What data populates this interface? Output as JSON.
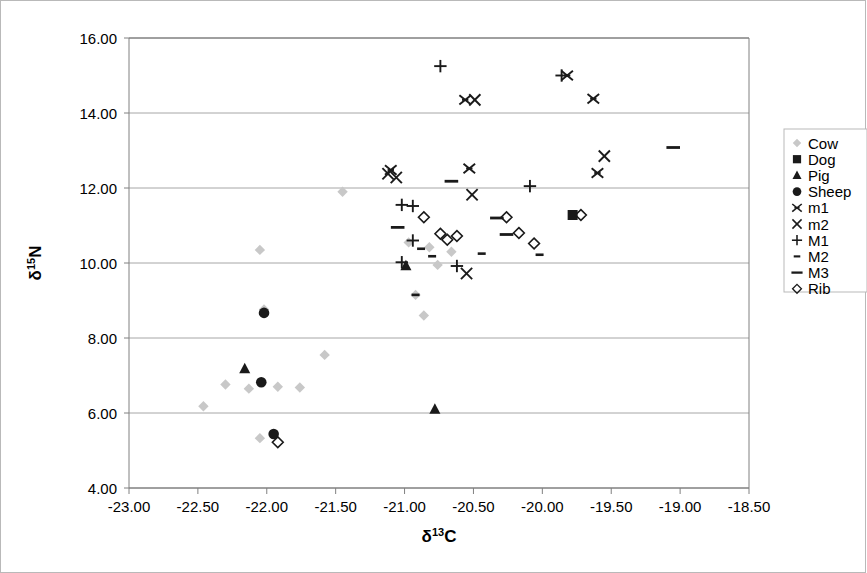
{
  "figure": {
    "background": "#ffffff",
    "frame_color": "#b9b9b9",
    "axis_color": "#808080",
    "grid_color": "#a6a6a6",
    "marker_color_dark": "#1a1a1a",
    "marker_color_light": "#c8c8c8"
  },
  "chart_data": {
    "type": "scatter",
    "title": "",
    "xlabel": "δ¹³C",
    "ylabel": "δ¹⁵N",
    "xlabel_parts": {
      "delta": "δ",
      "sup": "13",
      "element": "C"
    },
    "ylabel_parts": {
      "delta": "δ",
      "sup": "15",
      "element": "N"
    },
    "xlim": [
      -23.0,
      -18.5
    ],
    "ylim": [
      4.0,
      16.0
    ],
    "xticks": [
      -23.0,
      -22.5,
      -22.0,
      -21.5,
      -21.0,
      -20.5,
      -20.0,
      -19.5,
      -19.0,
      -18.5
    ],
    "yticks": [
      4.0,
      6.0,
      8.0,
      10.0,
      12.0,
      14.0,
      16.0
    ],
    "xtick_labels": [
      "-23.00",
      "-22.50",
      "-22.00",
      "-21.50",
      "-21.00",
      "-20.50",
      "-20.00",
      "-19.50",
      "-19.00",
      "-18.50"
    ],
    "ytick_labels": [
      "4.00",
      "6.00",
      "8.00",
      "10.00",
      "12.00",
      "14.00",
      "16.00"
    ],
    "grid": "horizontal",
    "legend_position": "right-outside",
    "series": [
      {
        "name": "Cow",
        "marker": "diamond-filled",
        "color": "#c8c8c8",
        "points": [
          {
            "x": -22.46,
            "y": 6.18
          },
          {
            "x": -22.3,
            "y": 6.76
          },
          {
            "x": -22.13,
            "y": 6.65
          },
          {
            "x": -21.92,
            "y": 6.7
          },
          {
            "x": -22.02,
            "y": 8.76
          },
          {
            "x": -22.05,
            "y": 5.33
          },
          {
            "x": -21.76,
            "y": 6.68
          },
          {
            "x": -21.58,
            "y": 7.55
          },
          {
            "x": -22.05,
            "y": 10.35
          },
          {
            "x": -21.45,
            "y": 11.9
          },
          {
            "x": -20.97,
            "y": 10.55
          },
          {
            "x": -20.82,
            "y": 10.42
          },
          {
            "x": -20.66,
            "y": 10.3
          },
          {
            "x": -20.76,
            "y": 9.95
          },
          {
            "x": -20.92,
            "y": 9.15
          },
          {
            "x": -20.86,
            "y": 8.6
          }
        ]
      },
      {
        "name": "Dog",
        "marker": "square-filled",
        "color": "#1a1a1a",
        "points": [
          {
            "x": -19.78,
            "y": 11.28
          }
        ]
      },
      {
        "name": "Pig",
        "marker": "triangle-filled",
        "color": "#1a1a1a",
        "points": [
          {
            "x": -22.16,
            "y": 7.18
          },
          {
            "x": -20.99,
            "y": 9.93
          },
          {
            "x": -20.78,
            "y": 6.1
          }
        ]
      },
      {
        "name": "Sheep",
        "marker": "circle-filled",
        "color": "#1a1a1a",
        "points": [
          {
            "x": -22.02,
            "y": 8.67
          },
          {
            "x": -22.04,
            "y": 6.82
          },
          {
            "x": -21.95,
            "y": 5.44
          }
        ]
      },
      {
        "name": "m1",
        "marker": "asterisk",
        "color": "#1a1a1a",
        "points": [
          {
            "x": -21.1,
            "y": 12.48
          },
          {
            "x": -20.56,
            "y": 14.35
          },
          {
            "x": -20.53,
            "y": 12.52
          },
          {
            "x": -19.82,
            "y": 15.0
          },
          {
            "x": -19.63,
            "y": 14.38
          },
          {
            "x": -19.6,
            "y": 12.4
          }
        ]
      },
      {
        "name": "m2",
        "marker": "x-cross",
        "color": "#1a1a1a",
        "points": [
          {
            "x": -21.12,
            "y": 12.38
          },
          {
            "x": -21.06,
            "y": 12.28
          },
          {
            "x": -20.49,
            "y": 14.35
          },
          {
            "x": -20.51,
            "y": 11.82
          },
          {
            "x": -20.55,
            "y": 9.72
          },
          {
            "x": -19.55,
            "y": 12.85
          }
        ]
      },
      {
        "name": "M1",
        "marker": "plus",
        "color": "#1a1a1a",
        "points": [
          {
            "x": -20.74,
            "y": 15.25
          },
          {
            "x": -19.86,
            "y": 15.0
          },
          {
            "x": -21.02,
            "y": 11.55
          },
          {
            "x": -20.94,
            "y": 11.52
          },
          {
            "x": -20.94,
            "y": 10.6
          },
          {
            "x": -21.02,
            "y": 10.02
          },
          {
            "x": -20.62,
            "y": 9.92
          },
          {
            "x": -20.09,
            "y": 12.05
          }
        ]
      },
      {
        "name": "M2",
        "marker": "dash-small",
        "color": "#1a1a1a",
        "points": [
          {
            "x": -20.88,
            "y": 10.38
          },
          {
            "x": -20.8,
            "y": 10.18
          },
          {
            "x": -20.44,
            "y": 10.25
          },
          {
            "x": -20.02,
            "y": 10.22
          },
          {
            "x": -20.92,
            "y": 9.15
          }
        ]
      },
      {
        "name": "M3",
        "marker": "dash-long",
        "color": "#1a1a1a",
        "points": [
          {
            "x": -21.05,
            "y": 10.95
          },
          {
            "x": -20.66,
            "y": 12.18
          },
          {
            "x": -20.33,
            "y": 11.2
          },
          {
            "x": -20.26,
            "y": 10.76
          },
          {
            "x": -19.05,
            "y": 13.08
          }
        ]
      },
      {
        "name": "Rib",
        "marker": "diamond-open",
        "color": "#1a1a1a",
        "points": [
          {
            "x": -20.86,
            "y": 11.22
          },
          {
            "x": -20.74,
            "y": 10.78
          },
          {
            "x": -20.69,
            "y": 10.62
          },
          {
            "x": -20.62,
            "y": 10.72
          },
          {
            "x": -20.26,
            "y": 11.22
          },
          {
            "x": -20.17,
            "y": 10.8
          },
          {
            "x": -20.06,
            "y": 10.52
          },
          {
            "x": -19.72,
            "y": 11.28
          },
          {
            "x": -21.92,
            "y": 5.22
          }
        ]
      }
    ],
    "legend": [
      {
        "label": "Cow",
        "marker": "diamond-filled",
        "color": "#c8c8c8"
      },
      {
        "label": "Dog",
        "marker": "square-filled",
        "color": "#1a1a1a"
      },
      {
        "label": "Pig",
        "marker": "triangle-filled",
        "color": "#1a1a1a"
      },
      {
        "label": "Sheep",
        "marker": "circle-filled",
        "color": "#1a1a1a"
      },
      {
        "label": "m1",
        "marker": "asterisk",
        "color": "#1a1a1a"
      },
      {
        "label": "m2",
        "marker": "x-cross",
        "color": "#1a1a1a"
      },
      {
        "label": "M1",
        "marker": "plus",
        "color": "#1a1a1a"
      },
      {
        "label": "M2",
        "marker": "dash-small",
        "color": "#1a1a1a"
      },
      {
        "label": "M3",
        "marker": "dash-long",
        "color": "#1a1a1a"
      },
      {
        "label": "Rib",
        "marker": "diamond-open",
        "color": "#1a1a1a"
      }
    ]
  }
}
